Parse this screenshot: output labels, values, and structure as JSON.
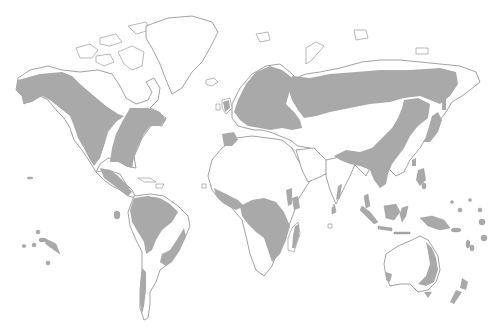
{
  "map": {
    "type": "world distribution map",
    "projection": "world outline, no graticule",
    "labels": [],
    "legend": [],
    "colors": {
      "background": "#ffffff",
      "land": "#ffffff",
      "coastline": "#8a8a8a",
      "shaded_range": "#a9a9a9"
    },
    "shaded_regions": [
      {
        "id": "north-america-west",
        "name": "Alaska, western Canada and western United States"
      },
      {
        "id": "north-america-east",
        "name": "Eastern Canada and eastern United States"
      },
      {
        "id": "central-america",
        "name": "Mexico and Central America"
      },
      {
        "id": "south-america-north",
        "name": "Amazon basin / northern South America"
      },
      {
        "id": "south-america-east",
        "name": "Southeastern Brazil and Paraguay"
      },
      {
        "id": "south-america-chile",
        "name": "Southern Chile"
      },
      {
        "id": "europe",
        "name": "Scandinavia and Europe"
      },
      {
        "id": "iberia",
        "name": "Iberian Peninsula"
      },
      {
        "id": "siberia",
        "name": "Boreal belt across Russia to the Pacific"
      },
      {
        "id": "east-asia",
        "name": "China, Korea and Southeast Asia"
      },
      {
        "id": "japan",
        "name": "Japan"
      },
      {
        "id": "india-west-coast",
        "name": "Western Ghats, India"
      },
      {
        "id": "sri-lanka",
        "name": "Sri Lanka"
      },
      {
        "id": "africa-west",
        "name": "West African coast"
      },
      {
        "id": "africa-central",
        "name": "Central and southeastern Africa"
      },
      {
        "id": "africa-horn",
        "name": "East African highlands"
      },
      {
        "id": "madagascar",
        "name": "Eastern Madagascar"
      },
      {
        "id": "indonesia",
        "name": "Indonesia and New Guinea"
      },
      {
        "id": "pacific-islands",
        "name": "Pacific islands"
      },
      {
        "id": "australia-east",
        "name": "Eastern Australia"
      },
      {
        "id": "australia-sw",
        "name": "Southwestern Australia"
      },
      {
        "id": "tasmania",
        "name": "Tasmania"
      },
      {
        "id": "new-zealand",
        "name": "New Zealand"
      }
    ]
  }
}
